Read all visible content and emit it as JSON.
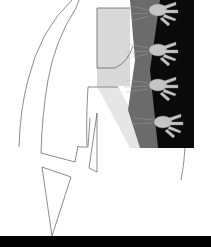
{
  "artwork": {
    "description": "Line drawing with photographic collage of hands",
    "colors": {
      "background": "#ffffff",
      "line": "#555555",
      "panel_light": "#d8d8d8",
      "panel_mid": "#6a6a6a",
      "panel_dark": "#0a0a0a",
      "hands": "#bdbdbd",
      "bottom_bar": "#000000"
    },
    "hands_count": 4
  }
}
